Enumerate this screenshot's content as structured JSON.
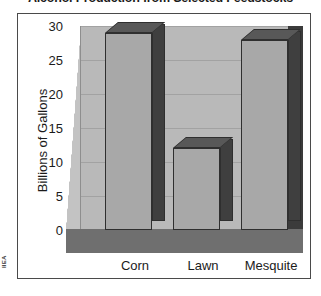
{
  "source_credit": "IIEA",
  "chart_data": {
    "type": "bar",
    "title": "Alcohol Production from Selected Feedstocks",
    "xlabel": "",
    "ylabel": "Billions of Gallons",
    "categories": [
      "Corn",
      "Lawn",
      "Mesquite"
    ],
    "values": [
      29,
      12,
      28
    ],
    "ylim": [
      0,
      30
    ],
    "yticks": [
      30,
      25,
      20,
      15,
      10,
      5,
      0
    ],
    "grid": true,
    "legend": "none",
    "style": "3d-bar",
    "colors": {
      "bar_face": "#a8a8a8",
      "bar_side": "#3f3f3f",
      "bar_top": "#585858",
      "back_wall": "#b9b9b9",
      "floor": "#6f6f6f",
      "right_wall": "#3b3b3b",
      "gridline": "#a2a2a2",
      "frame": "#4a4a4a",
      "text": "#1b1b1b"
    }
  }
}
